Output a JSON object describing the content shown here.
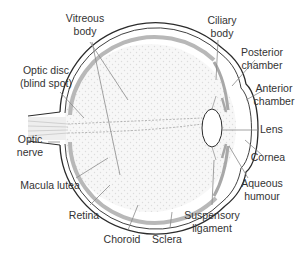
{
  "diagram": {
    "colors": {
      "outline": "#2b2b2b",
      "choroid_band": "#b8b8b8",
      "vitreous_fill": "#f4f4f4",
      "dot": "#dcdcdc",
      "leader": "#8a8a8a",
      "text": "#333333"
    },
    "labels": {
      "vitreous_body": {
        "line1": "Vitreous",
        "line2": "body"
      },
      "optic_disc": {
        "line1": "Optic disc",
        "line2": "(blind spot)"
      },
      "optic_nerve": {
        "line1": "Optic",
        "line2": "nerve"
      },
      "macula_lutea": {
        "line1": "Macula lutea"
      },
      "retina": {
        "line1": "Retina"
      },
      "choroid": {
        "line1": "Choroid"
      },
      "sclera": {
        "line1": "Sclera"
      },
      "suspensory_ligament": {
        "line1": "Suspensory",
        "line2": "ligament"
      },
      "aqueous_humour": {
        "line1": "Aqueous",
        "line2": "humour"
      },
      "cornea": {
        "line1": "Cornea"
      },
      "lens": {
        "line1": "Lens"
      },
      "anterior_chamber": {
        "line1": "Anterior",
        "line2": "chamber"
      },
      "posterior_chamber": {
        "line1": "Posterior",
        "line2": "chamber"
      },
      "ciliary_body": {
        "line1": "Ciliary",
        "line2": "body"
      }
    }
  }
}
